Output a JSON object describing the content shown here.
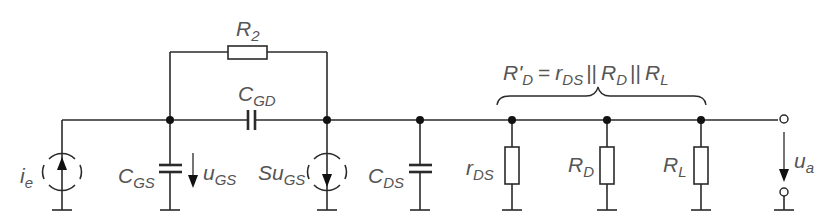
{
  "diagram": {
    "type": "small-signal equivalent circuit",
    "colors": {
      "line": "#2a2a2a",
      "label": "#555555",
      "background": "#ffffff"
    },
    "labels": {
      "R2": {
        "main": "R",
        "sub": "2"
      },
      "CGD": {
        "main": "C",
        "sub": "GD"
      },
      "ie": {
        "main": "i",
        "sub": "e"
      },
      "CGS": {
        "main": "C",
        "sub": "GS"
      },
      "uGS": {
        "main": "u",
        "sub": "GS"
      },
      "SuGS": {
        "main": "Su",
        "sub": "GS"
      },
      "CDS": {
        "main": "C",
        "sub": "DS"
      },
      "rDS": {
        "main": "r",
        "sub": "DS"
      },
      "RD": {
        "main": "R",
        "sub": "D"
      },
      "RL": {
        "main": "R",
        "sub": "L"
      },
      "ua": {
        "main": "u",
        "sub": "a"
      }
    },
    "equation": {
      "lhs_main": "R'",
      "lhs_sub": "D",
      "equals": "=",
      "t1_main": "r",
      "t1_sub": "DS",
      "par1": "||",
      "t2_main": "R",
      "t2_sub": "D",
      "par2": "||",
      "t3_main": "R",
      "t3_sub": "L"
    },
    "components": [
      "current source i_e",
      "capacitor C_GS",
      "voltage arrow u_GS",
      "resistor R_2",
      "capacitor C_GD",
      "controlled current source S·u_GS",
      "capacitor C_DS",
      "resistor r_DS",
      "resistor R_D",
      "resistor R_L",
      "output voltage u_a"
    ]
  }
}
